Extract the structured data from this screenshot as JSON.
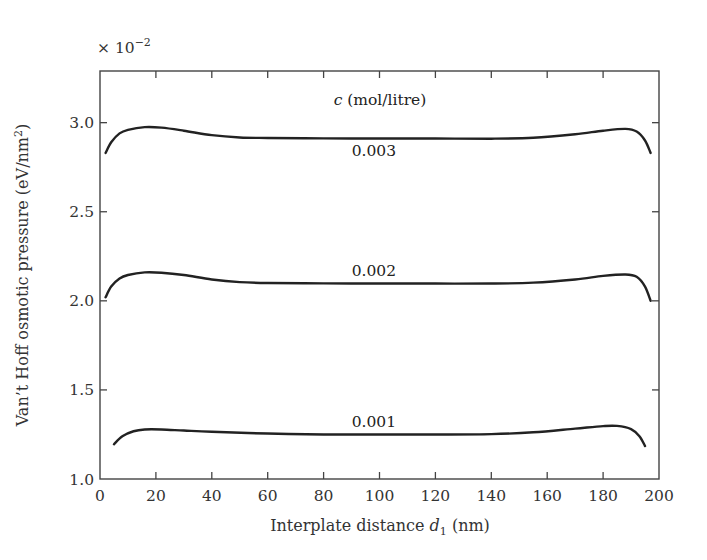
{
  "chart_data": {
    "type": "line",
    "title": "",
    "xlabel": "Interplate distance d1 (nm)",
    "xlabel_parts": {
      "main": "Interplate distance ",
      "var": "d",
      "sub": "1",
      "unit": " (nm)"
    },
    "ylabel": "Van't Hoff osmotic pressure (eV/nm²)",
    "ylabel_parts": {
      "main": "Van’t Hoff osmotic pressure (eV/nm",
      "sup": "2",
      "close": ")"
    },
    "y_multiplier": "× 10⁻²",
    "y_multiplier_parts": {
      "base": "× 10",
      "exp": "−2"
    },
    "xlim": [
      0,
      200
    ],
    "ylim": [
      1.0,
      3.29
    ],
    "x_ticks": [
      0,
      20,
      40,
      60,
      80,
      100,
      120,
      140,
      160,
      180,
      200
    ],
    "y_ticks": [
      1.0,
      1.5,
      2.0,
      2.5,
      3.0
    ],
    "y_tick_labels": [
      "1.0",
      "1.5",
      "2.0",
      "2.5",
      "3.0"
    ],
    "grid": false,
    "legend": {
      "title": "c (mol/litre)",
      "title_var": "c",
      "title_rest": " (mol/litre)",
      "position": "inline-labels"
    },
    "series": [
      {
        "name": "0.003",
        "x": [
          2,
          4,
          7,
          10,
          16,
          22,
          30,
          40,
          50,
          60,
          80,
          100,
          120,
          140,
          155,
          170,
          180,
          188,
          192,
          195,
          197
        ],
        "y": [
          2.83,
          2.89,
          2.94,
          2.96,
          2.975,
          2.972,
          2.955,
          2.93,
          2.917,
          2.914,
          2.912,
          2.911,
          2.911,
          2.91,
          2.915,
          2.935,
          2.955,
          2.965,
          2.95,
          2.9,
          2.83
        ],
        "label_pos": {
          "x": 98,
          "y": 2.84
        }
      },
      {
        "name": "0.002",
        "x": [
          2,
          4,
          7,
          10,
          16,
          22,
          30,
          40,
          50,
          60,
          80,
          100,
          120,
          140,
          155,
          170,
          180,
          188,
          192,
          195,
          197
        ],
        "y": [
          2.02,
          2.08,
          2.125,
          2.145,
          2.16,
          2.158,
          2.145,
          2.12,
          2.105,
          2.1,
          2.098,
          2.097,
          2.097,
          2.097,
          2.102,
          2.12,
          2.14,
          2.148,
          2.135,
          2.08,
          2.0
        ],
        "label_pos": {
          "x": 98,
          "y": 2.165
        }
      },
      {
        "name": "0.001",
        "x": [
          5,
          8,
          12,
          16,
          22,
          30,
          40,
          60,
          80,
          100,
          120,
          140,
          155,
          170,
          180,
          185,
          190,
          193,
          195
        ],
        "y": [
          1.195,
          1.24,
          1.268,
          1.278,
          1.278,
          1.272,
          1.265,
          1.255,
          1.25,
          1.25,
          1.25,
          1.252,
          1.262,
          1.283,
          1.297,
          1.298,
          1.28,
          1.24,
          1.185
        ],
        "label_pos": {
          "x": 98,
          "y": 1.32
        }
      }
    ],
    "line_color": "#222222"
  }
}
